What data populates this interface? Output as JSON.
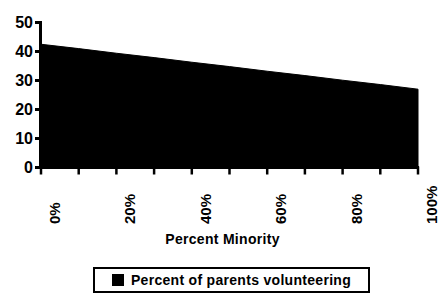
{
  "chart_data": {
    "type": "area",
    "title": "",
    "xlabel": "Percent  Minority",
    "ylabel": "",
    "x": [
      0,
      10,
      20,
      30,
      40,
      50,
      60,
      70,
      80,
      90,
      100
    ],
    "series": [
      {
        "name": "Percent of parents volunteering",
        "color": "#000000",
        "values": [
          42.5,
          41.0,
          39.4,
          37.9,
          36.3,
          34.8,
          33.2,
          31.7,
          30.1,
          28.6,
          27.0
        ]
      }
    ],
    "xlim": [
      0,
      100
    ],
    "ylim": [
      0,
      50
    ],
    "ytick_values": [
      0,
      10,
      20,
      30,
      40,
      50
    ],
    "ytick_labels": [
      "0",
      "10",
      "20",
      "30",
      "40",
      "50"
    ],
    "xtick_values": [
      0,
      10,
      20,
      30,
      40,
      50,
      60,
      70,
      80,
      90,
      100
    ],
    "xtick_labels": [
      "0%",
      "",
      "20%",
      "",
      "40%",
      "",
      "60%",
      "",
      "80%",
      "",
      "100%"
    ],
    "xtick_label_rotation": 90,
    "grid": false,
    "legend_position": "bottom",
    "fill": "solid-black",
    "annotations": []
  },
  "axes": {
    "x_title": "Percent  Minority",
    "y_tick_labels": [
      "50",
      "40",
      "30",
      "20",
      "10",
      "0"
    ]
  },
  "legend": {
    "entries": [
      {
        "label": "Percent of parents volunteering",
        "swatch_color": "#000000"
      }
    ]
  },
  "artifacts": {
    "top_title_remnant": ""
  }
}
